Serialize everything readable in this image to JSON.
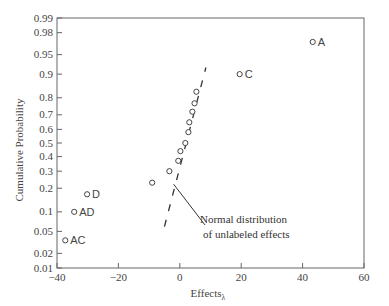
{
  "chart_data": {
    "type": "scatter",
    "title": "",
    "xlabel": "Effects",
    "xlabel_subscript": "λ",
    "ylabel": "Cumulative Probability",
    "xlim": [
      -40,
      60
    ],
    "ylim": [
      0.01,
      0.99
    ],
    "yscale": "normal-probability",
    "grid": false,
    "x_ticks": [
      -40,
      -20,
      0,
      20,
      40,
      60
    ],
    "x_tick_labels": [
      "−40",
      "−20",
      "0",
      "20",
      "40",
      "60"
    ],
    "y_ticks": [
      0.01,
      0.02,
      0.05,
      0.1,
      0.2,
      0.3,
      0.4,
      0.5,
      0.6,
      0.7,
      0.8,
      0.9,
      0.95,
      0.98,
      0.99
    ],
    "y_tick_labels": [
      "0.01",
      "0.02",
      "0.05",
      "0.1",
      "0.2",
      "0.3",
      "0.4",
      "0.5",
      "0.6",
      "0.7",
      "0.8",
      "0.9",
      "0.95",
      "0.98",
      "0.99"
    ],
    "labeled_points": [
      {
        "label": "A",
        "x": 43.3,
        "p": 0.97
      },
      {
        "label": "C",
        "x": 19.5,
        "p": 0.9
      },
      {
        "label": "D",
        "x": -30.2,
        "p": 0.17
      },
      {
        "label": "AD",
        "x": -34.4,
        "p": 0.1
      },
      {
        "label": "AC",
        "x": -37.3,
        "p": 0.035
      }
    ],
    "unlabeled_points": [
      {
        "x": 5.4,
        "p": 0.83
      },
      {
        "x": 4.8,
        "p": 0.77
      },
      {
        "x": 4.1,
        "p": 0.72
      },
      {
        "x": 3.1,
        "p": 0.65
      },
      {
        "x": 2.8,
        "p": 0.58
      },
      {
        "x": 1.8,
        "p": 0.5
      },
      {
        "x": 0.2,
        "p": 0.44
      },
      {
        "x": -0.5,
        "p": 0.37
      },
      {
        "x": -3.4,
        "p": 0.3
      },
      {
        "x": -9.0,
        "p": 0.23
      }
    ],
    "reference_line": {
      "style": "dashed",
      "from": {
        "x": -5.0,
        "p": 0.06
      },
      "to": {
        "x": 8.5,
        "p": 0.92
      }
    },
    "annotations": [
      {
        "text_line1": "Normal distribution",
        "text_line2": "of unlabeled effects",
        "points_to": {
          "x": -2,
          "p": 0.2
        }
      }
    ]
  }
}
